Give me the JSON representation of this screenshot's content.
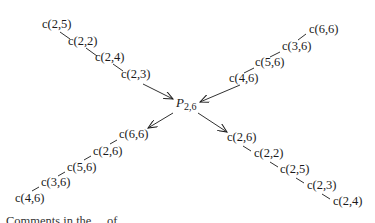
{
  "center_node": {
    "symbol": "P",
    "subscript": "2,6"
  },
  "branches": {
    "top_left": {
      "direction": "into-center",
      "nodes": [
        "c(2,5)",
        "c(2,2)",
        "c(2,4)",
        "c(2,3)"
      ]
    },
    "top_right": {
      "direction": "into-center",
      "nodes": [
        "c(6,6)",
        "c(3,6)",
        "c(5,6)",
        "c(4,6)"
      ]
    },
    "bottom_left": {
      "direction": "out-of-center",
      "nodes": [
        "c(6,6)",
        "c(2,6)",
        "c(5,6)",
        "c(3,6)",
        "c(4,6)"
      ]
    },
    "bottom_right": {
      "direction": "out-of-center",
      "nodes": [
        "c(2,6)",
        "c(2,2)",
        "c(2,5)",
        "c(2,3)",
        "c(2,4)"
      ]
    }
  },
  "caption": "Comments in the ... of ..."
}
